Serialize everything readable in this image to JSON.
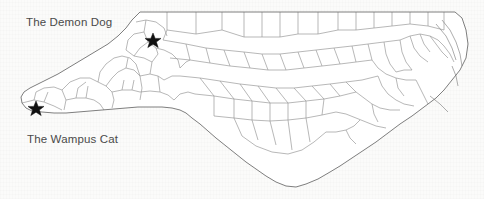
{
  "document": {
    "type": "scanned-map",
    "subject": "North Carolina county outline map",
    "background_color": "#fbfbfa"
  },
  "map": {
    "name": "north-carolina-county-map",
    "outline_color": "#6f6f6f",
    "county_line_color": "#9a9a9a",
    "fill_color": "#ffffff"
  },
  "annotations": [
    {
      "id": "demon-dog",
      "label": "The Demon Dog",
      "label_x": 26,
      "label_y": 16,
      "marker": "star",
      "marker_x": 153,
      "marker_y": 40,
      "marker_color": "#111111"
    },
    {
      "id": "wampus-cat",
      "label": "The Wampus Cat",
      "label_x": 27,
      "label_y": 133,
      "marker": "star",
      "marker_x": 36,
      "marker_y": 108,
      "marker_color": "#111111"
    }
  ]
}
